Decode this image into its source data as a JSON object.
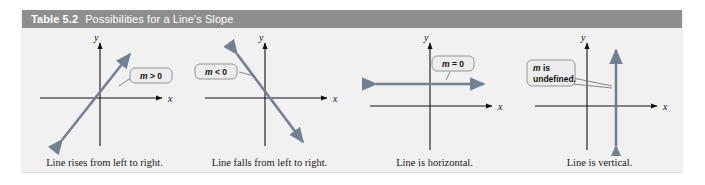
{
  "figure": {
    "table_number": "Table 5.2",
    "title": "Possibilities for a Line's Slope",
    "header_bg": "#8e8e8e",
    "body_bg": "#f1f1f1",
    "line_color": "#73808f",
    "axis_color": "#111111"
  },
  "panels": [
    {
      "id": "positive-slope",
      "callout": "m > 0",
      "callout_math_symbol": "m",
      "callout_rest": " > 0",
      "caption": "Line rises from left to right.",
      "axis_x_label": "x",
      "axis_y_label": "y",
      "line_type": "rising-diagonal"
    },
    {
      "id": "negative-slope",
      "callout": "m < 0",
      "callout_math_symbol": "m",
      "callout_rest": " < 0",
      "caption": "Line falls from left to right.",
      "axis_x_label": "x",
      "axis_y_label": "y",
      "line_type": "falling-diagonal"
    },
    {
      "id": "zero-slope",
      "callout": "m = 0",
      "callout_math_symbol": "m",
      "callout_rest": " = 0",
      "caption": "Line is horizontal.",
      "axis_x_label": "x",
      "axis_y_label": "y",
      "line_type": "horizontal"
    },
    {
      "id": "undefined-slope",
      "callout": "m is undefined.",
      "callout_math_symbol": "m",
      "callout_rest": " is",
      "callout_line2": "undefined.",
      "caption": "Line is vertical.",
      "axis_x_label": "x",
      "axis_y_label": "y",
      "line_type": "vertical"
    }
  ]
}
